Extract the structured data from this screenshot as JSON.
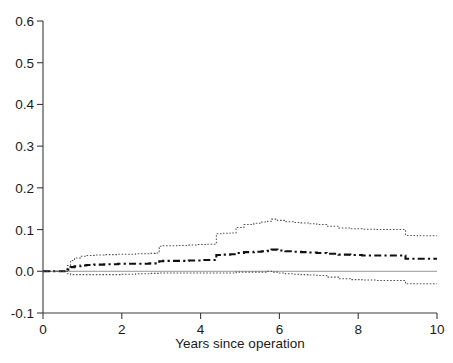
{
  "chart_data": {
    "type": "line",
    "title": "",
    "subtitle": "",
    "xlabel": "Years since operation",
    "ylabel": "",
    "xlim": [
      0,
      10
    ],
    "ylim": [
      -0.1,
      0.6
    ],
    "xticks": [
      0,
      2,
      4,
      6,
      8,
      10
    ],
    "xtick_labels": [
      "0",
      "2",
      "4",
      "6",
      "8",
      "10"
    ],
    "yticks": [
      -0.1,
      0.0,
      0.1,
      0.2,
      0.3,
      0.4,
      0.5,
      0.6
    ],
    "ytick_labels": [
      "-0.1",
      "0.0",
      "0.1",
      "0.2",
      "0.3",
      "0.4",
      "0.5",
      "0.6"
    ],
    "grid": false,
    "legend": null,
    "legend_position": "none",
    "annotations": [],
    "reference_lines": [
      {
        "name": "zero-reference",
        "orientation": "horizontal",
        "y": 0.0,
        "style": "solid",
        "color": "#8a8a8a"
      }
    ],
    "series": [
      {
        "name": "upper-confidence-limit",
        "style": "dotted",
        "color": "#555555",
        "step": "post",
        "x": [
          0.0,
          0.55,
          0.62,
          0.7,
          0.8,
          0.95,
          1.1,
          1.3,
          1.55,
          1.75,
          1.9,
          2.0,
          2.35,
          2.7,
          2.85,
          2.95,
          3.05,
          3.4,
          3.7,
          3.9,
          4.0,
          4.15,
          4.4,
          4.55,
          4.75,
          4.9,
          5.1,
          5.35,
          5.55,
          5.7,
          5.8,
          5.95,
          6.15,
          6.35,
          6.55,
          6.75,
          6.95,
          7.2,
          7.5,
          7.8,
          8.1,
          8.45,
          8.8,
          9.1,
          9.2,
          9.5,
          9.8,
          10.0
        ],
        "y": [
          0.0,
          0.0,
          0.014,
          0.026,
          0.032,
          0.036,
          0.038,
          0.039,
          0.04,
          0.04,
          0.041,
          0.041,
          0.042,
          0.043,
          0.044,
          0.06,
          0.061,
          0.062,
          0.063,
          0.064,
          0.064,
          0.065,
          0.09,
          0.091,
          0.092,
          0.105,
          0.112,
          0.115,
          0.118,
          0.12,
          0.125,
          0.122,
          0.119,
          0.117,
          0.116,
          0.114,
          0.112,
          0.108,
          0.104,
          0.102,
          0.101,
          0.1,
          0.1,
          0.1,
          0.086,
          0.085,
          0.085,
          0.085
        ]
      },
      {
        "name": "point-estimate",
        "style": "dash-dot",
        "color": "#111111",
        "step": "post",
        "x": [
          0.0,
          0.55,
          0.62,
          0.7,
          0.8,
          0.95,
          1.1,
          1.3,
          1.55,
          1.75,
          1.9,
          2.0,
          2.35,
          2.7,
          2.85,
          2.95,
          3.05,
          3.4,
          3.7,
          3.9,
          4.0,
          4.15,
          4.4,
          4.55,
          4.75,
          4.9,
          5.1,
          5.35,
          5.55,
          5.7,
          5.8,
          5.95,
          6.15,
          6.35,
          6.55,
          6.75,
          6.95,
          7.2,
          7.5,
          7.8,
          8.1,
          8.45,
          8.8,
          9.1,
          9.2,
          9.5,
          9.8,
          10.0
        ],
        "y": [
          0.0,
          0.0,
          0.004,
          0.01,
          0.012,
          0.014,
          0.015,
          0.016,
          0.017,
          0.017,
          0.018,
          0.018,
          0.018,
          0.019,
          0.019,
          0.024,
          0.025,
          0.025,
          0.026,
          0.026,
          0.027,
          0.027,
          0.039,
          0.04,
          0.041,
          0.044,
          0.046,
          0.047,
          0.048,
          0.049,
          0.052,
          0.05,
          0.048,
          0.047,
          0.046,
          0.045,
          0.044,
          0.042,
          0.04,
          0.039,
          0.038,
          0.038,
          0.038,
          0.038,
          0.03,
          0.03,
          0.03,
          0.03
        ]
      },
      {
        "name": "lower-confidence-limit",
        "style": "dotted",
        "color": "#555555",
        "step": "post",
        "x": [
          0.0,
          0.55,
          0.62,
          0.7,
          0.8,
          0.95,
          1.1,
          1.3,
          1.55,
          1.75,
          1.9,
          2.0,
          2.35,
          2.7,
          2.85,
          2.95,
          3.05,
          3.4,
          3.7,
          3.9,
          4.0,
          4.15,
          4.4,
          4.55,
          4.75,
          4.9,
          5.1,
          5.35,
          5.55,
          5.7,
          5.8,
          5.95,
          6.15,
          6.35,
          6.55,
          6.75,
          6.95,
          7.2,
          7.5,
          7.8,
          8.1,
          8.45,
          8.8,
          9.1,
          9.2,
          9.5,
          9.8,
          10.0
        ],
        "y": [
          0.0,
          0.0,
          -0.006,
          -0.008,
          -0.008,
          -0.008,
          -0.008,
          -0.008,
          -0.008,
          -0.008,
          -0.008,
          -0.007,
          -0.006,
          -0.005,
          -0.005,
          -0.004,
          -0.004,
          -0.004,
          -0.004,
          -0.004,
          -0.004,
          -0.004,
          -0.004,
          -0.004,
          -0.004,
          -0.002,
          -0.002,
          -0.002,
          -0.002,
          0.0,
          -0.002,
          -0.004,
          -0.006,
          -0.007,
          -0.008,
          -0.009,
          -0.01,
          -0.014,
          -0.018,
          -0.02,
          -0.021,
          -0.022,
          -0.022,
          -0.022,
          -0.03,
          -0.03,
          -0.03,
          -0.03
        ]
      }
    ]
  },
  "axes": {
    "x_axis_name": "x-axis",
    "y_axis_name": "y-axis"
  }
}
